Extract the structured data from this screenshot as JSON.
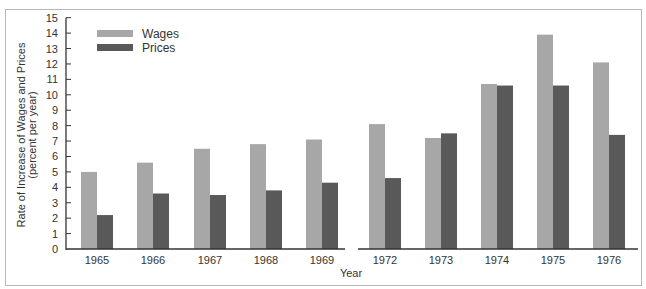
{
  "chart_data": {
    "type": "bar",
    "title": "",
    "xlabel": "Year",
    "ylabel": "Rate of Increase of Wages and Prices (percent per year)",
    "ylabel_lines": [
      "Rate of Increase of Wages and Prices",
      "(percent per year)"
    ],
    "ylim": [
      0,
      15
    ],
    "yticks": [
      0,
      1,
      2,
      3,
      4,
      5,
      6,
      7,
      8,
      9,
      10,
      11,
      12,
      13,
      14,
      15
    ],
    "grid": false,
    "legend_position": "upper-left",
    "axis_break": "between 1969 and 1972",
    "categories": [
      "1965",
      "1966",
      "1967",
      "1968",
      "1969",
      "1972",
      "1973",
      "1974",
      "1975",
      "1976"
    ],
    "series": [
      {
        "name": "Wages",
        "color": "#a7a7a7",
        "values": [
          5.0,
          5.6,
          6.5,
          6.8,
          7.1,
          8.1,
          7.2,
          10.7,
          13.9,
          12.1
        ]
      },
      {
        "name": "Prices",
        "color": "#595959",
        "values": [
          2.2,
          3.6,
          3.5,
          3.8,
          4.3,
          4.6,
          7.5,
          10.6,
          10.6,
          7.4
        ]
      }
    ]
  },
  "legend": {
    "wages_label": "Wages",
    "prices_label": "Prices"
  },
  "axis": {
    "x_title": "Year",
    "y_title_line1": "Rate of Increase of Wages and Prices",
    "y_title_line2": "(percent per year)"
  }
}
